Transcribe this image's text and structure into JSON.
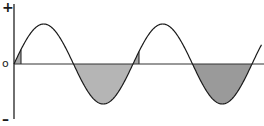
{
  "diagram": {
    "type": "sine-wave",
    "axis_labels": {
      "positive": "+",
      "zero": "o",
      "negative": "–"
    },
    "geometry": {
      "y_axis_x": 14,
      "y_axis_top": 4,
      "y_axis_bottom": 119,
      "baseline_y": 64,
      "baseline_x_end": 264,
      "amplitude": 40,
      "wave_start_x": 14,
      "period": 119,
      "cycles": 2.08
    },
    "colors": {
      "line": "#1a1a1a",
      "axis": "#333333",
      "shade_light": "#b5b5b5",
      "shade_dark": "#9a9a9a",
      "sliver": "#a8a8a8"
    },
    "shaded_regions": [
      {
        "name": "first-sliver",
        "x_from": 14,
        "x_to": 21,
        "side": "positive"
      },
      {
        "name": "first-negative-lobe",
        "x_from": 73,
        "x_to": 133,
        "side": "negative"
      },
      {
        "name": "second-sliver",
        "x_from": 133,
        "x_to": 139,
        "side": "positive"
      },
      {
        "name": "second-negative-lobe",
        "x_from": 192,
        "x_to": 251,
        "side": "negative"
      }
    ]
  }
}
